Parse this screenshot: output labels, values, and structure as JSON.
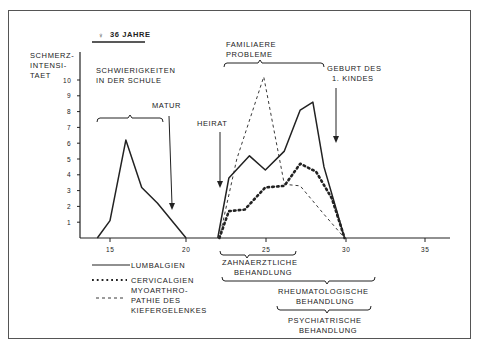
{
  "header": {
    "patient": "♀ 36 JAHRE"
  },
  "chart_data": {
    "type": "line",
    "title": "",
    "xlabel": "Alter (Jahre)",
    "ylabel": "SCHMERZ-INTENSI-TAET",
    "ylim": [
      0,
      10
    ],
    "xlim": [
      13,
      37
    ],
    "x_ticks": [
      15,
      20,
      25,
      30,
      35
    ],
    "y_ticks": [
      1,
      2,
      3,
      4,
      5,
      6,
      7,
      8,
      9,
      10
    ],
    "grid": false,
    "series": [
      {
        "name": "LUMBALGIEN",
        "style": "solid",
        "points": [
          [
            14.2,
            0
          ],
          [
            15,
            1.1
          ],
          [
            16,
            6.2
          ],
          [
            17,
            3.2
          ],
          [
            18,
            2.2
          ],
          [
            19.8,
            0
          ],
          [
            21.8,
            0
          ],
          [
            22.5,
            3.8
          ],
          [
            23.8,
            5.2
          ],
          [
            24.8,
            4.3
          ],
          [
            26,
            5.5
          ],
          [
            27,
            8.1
          ],
          [
            27.8,
            8.6
          ],
          [
            28.5,
            4.5
          ],
          [
            29.8,
            0
          ]
        ]
      },
      {
        "name": "CERVICALGIEN",
        "style": "dotted",
        "points": [
          [
            21.9,
            0
          ],
          [
            22.5,
            1.7
          ],
          [
            23.5,
            1.8
          ],
          [
            24.8,
            3.2
          ],
          [
            26,
            3.3
          ],
          [
            27,
            4.7
          ],
          [
            28,
            4.2
          ],
          [
            29,
            2.5
          ],
          [
            29.8,
            0
          ]
        ]
      },
      {
        "name": "MYOARTHROPATHIE DES KIEFERGELENKES",
        "style": "dashed",
        "points": [
          [
            21.9,
            0
          ],
          [
            23,
            5
          ],
          [
            24.7,
            10.2
          ],
          [
            26,
            3.4
          ],
          [
            27,
            3.3
          ],
          [
            28.5,
            1.5
          ],
          [
            29.8,
            0
          ]
        ]
      }
    ],
    "annotations": [
      {
        "text": "SCHWIERIGKEITEN IN DER SCHULE",
        "type": "brace",
        "x_range": [
          14.8,
          18.6
        ]
      },
      {
        "text": "MATUR",
        "type": "arrow",
        "x": 19.2
      },
      {
        "text": "HEIRAT",
        "type": "arrow",
        "x": 22
      },
      {
        "text": "FAMILIAERE PROBLEME",
        "type": "brace",
        "x_range": [
          22.3,
          29.2
        ]
      },
      {
        "text": "GEBURT DES 1. KINDES",
        "type": "arrow",
        "x": 29.4
      },
      {
        "text": "ZAHNAERZTLICHE BEHANDLUNG",
        "type": "brace",
        "x_range": [
          22.3,
          27
        ]
      },
      {
        "text": "RHEUMATOLOGISCHE BEHANDLUNG",
        "type": "brace",
        "x_range": [
          22.3,
          32.5
        ]
      },
      {
        "text": "PSYCHIATRISCHE BEHANDLUNG",
        "type": "brace",
        "x_range": [
          26,
          32.5
        ]
      }
    ],
    "legend_position": "bottom-left"
  },
  "labels": {
    "y1": "SCHMERZ-",
    "y2": "INTENSI-",
    "y3": "TAET",
    "school1": "SCHWIERIGKEITEN",
    "school2": "IN DER SCHULE",
    "matur": "MATUR",
    "heirat": "HEIRAT",
    "fam1": "FAMILIAERE",
    "fam2": "PROBLEME",
    "geb1": "GEBURT DES",
    "geb2": "1. KINDES",
    "zahn1": "ZAHNAERZTLICHE",
    "zahn2": "BEHANDLUNG",
    "rheu1": "RHEUMATOLOGISCHE",
    "rheu2": "BEHANDLUNG",
    "psy1": "PSYCHIATRISCHE",
    "psy2": "BEHANDLUNG",
    "leg1": "LUMBALGIEN",
    "leg2": "CERVICALGIEN",
    "leg3a": "MYOARTHRO-",
    "leg3b": "PATHIE DES",
    "leg3c": "KIEFERGELENKES",
    "x15": "15",
    "x20": "20",
    "x25": "25",
    "x30": "30",
    "x35": "35"
  }
}
